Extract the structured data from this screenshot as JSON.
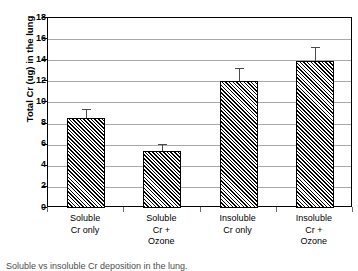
{
  "chart_data": {
    "type": "bar",
    "title": "",
    "xlabel": "",
    "ylabel": "Total Cr (ug) in the lung",
    "ylim": [
      0,
      18
    ],
    "ytick_step": 2,
    "yticks": [
      18,
      16,
      14,
      12,
      10,
      8,
      6,
      4,
      2,
      0
    ],
    "ytick_labels": [
      "18",
      "16",
      "14",
      "12",
      "10",
      "8",
      "6",
      "4",
      "2",
      "0"
    ],
    "grid": "horizontal",
    "legend": "none",
    "categories": [
      "Soluble Cr only",
      "Soluble Cr + Ozone",
      "Insoluble Cr only",
      "Insoluble Cr + Ozone"
    ],
    "category_label_lines": [
      [
        "Soluble",
        "Cr only"
      ],
      [
        "Soluble",
        "Cr +",
        "Ozone"
      ],
      [
        "Insoluble",
        "Cr only"
      ],
      [
        "Insoluble",
        "Cr +",
        "Ozone"
      ]
    ],
    "values": [
      8.5,
      5.4,
      12.0,
      13.9
    ],
    "errors": [
      0.9,
      0.7,
      1.3,
      1.4
    ],
    "bar_fill": "black-diagonal-hatch",
    "bar_edge_color": "#000000",
    "grid_color": "#a8a8a8",
    "axis_color": "#000000"
  },
  "caption": {
    "stub_text": "Soluble vs insoluble Cr deposition in the lung."
  }
}
